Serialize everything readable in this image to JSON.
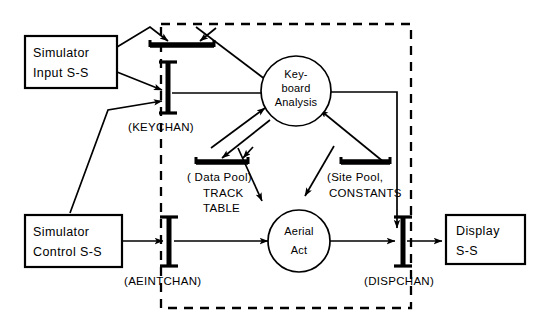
{
  "diagram": {
    "colors": {
      "ink": "#000000",
      "paper": "#ffffff"
    },
    "boxes": [
      {
        "id": "sim-input",
        "line1": "Simulator",
        "line2": "Input S-S"
      },
      {
        "id": "sim-control",
        "line1": "Simulator",
        "line2": "Control S-S"
      },
      {
        "id": "display",
        "line1": "Display",
        "line2": "S-S"
      }
    ],
    "processes": [
      {
        "id": "keyboard-analysis",
        "line1": "Key-",
        "line2": "board",
        "line3": "Analysis"
      },
      {
        "id": "aerial-act",
        "line1": "Aerial",
        "line2": "Act",
        "line3": ""
      }
    ],
    "channels": [
      {
        "id": "keychan",
        "label": "(KEYCHAN)"
      },
      {
        "id": "aeintchan",
        "label": "(AEINTCHAN)"
      },
      {
        "id": "dispchan",
        "label": "(DISPCHAN)"
      }
    ],
    "pools": [
      {
        "id": "data-pool",
        "line1": "( Data Pool)",
        "line2": "TRACK",
        "line3": "TABLE"
      },
      {
        "id": "site-pool",
        "line1": "(Site Pool,",
        "line2": "CONSTANTS",
        "line3": ""
      }
    ],
    "boundary": {
      "id": "system-boundary",
      "style": "dashed"
    }
  }
}
